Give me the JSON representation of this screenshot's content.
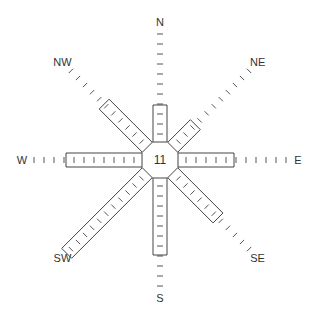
{
  "diagram": {
    "type": "wind-rose",
    "calm_value": "11",
    "center": [
      160,
      160
    ],
    "octagon_radius": 18,
    "axis_length": 130,
    "tick_spacing": 10,
    "bar_width": 14,
    "line_color": "#444444",
    "tick_color": "#555555",
    "directions": [
      {
        "label": "N",
        "angle": 0,
        "bar_length": 47
      },
      {
        "label": "NE",
        "angle": 45,
        "bar_length": 42
      },
      {
        "label": "E",
        "angle": 90,
        "bar_length": 66
      },
      {
        "label": "SE",
        "angle": 135,
        "bar_length": 74
      },
      {
        "label": "S",
        "angle": 180,
        "bar_length": 87
      },
      {
        "label": "SW",
        "angle": 225,
        "bar_length": 124
      },
      {
        "label": "W",
        "angle": 270,
        "bar_length": 86
      },
      {
        "label": "NW",
        "angle": 315,
        "bar_length": 71
      }
    ]
  }
}
